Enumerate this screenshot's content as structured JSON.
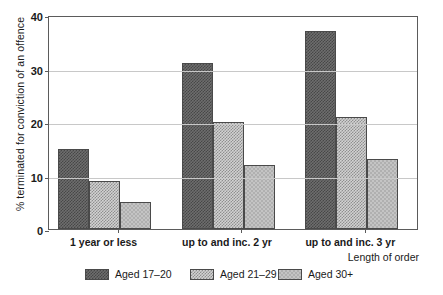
{
  "chart_data": {
    "type": "bar",
    "title": "",
    "xlabel": "Length of order",
    "ylabel": "% terminated for conviction of an offence",
    "categories": [
      "1 year or less",
      "up to and inc. 2 yr",
      "up to and inc. 3 yr"
    ],
    "series": [
      {
        "name": "Aged 17–20",
        "values": [
          15,
          31,
          37
        ],
        "pattern": "dark-checker",
        "color": "#5a5a5a"
      },
      {
        "name": "Aged 21–29",
        "values": [
          9,
          20,
          21
        ],
        "pattern": "mid-checker",
        "color": "#b4b4b4"
      },
      {
        "name": "Aged 30+",
        "values": [
          5,
          12,
          13
        ],
        "pattern": "light-checker",
        "color": "#c4c4c4"
      }
    ],
    "ylim": [
      0,
      40
    ],
    "yticks": [
      0,
      10,
      20,
      30,
      40
    ],
    "ytick_labels": [
      "0",
      "10",
      "20",
      "30",
      "40"
    ],
    "grid": true,
    "legend_position": "bottom"
  },
  "axes": {
    "y_title": "% terminated for conviction of an offence",
    "x_title": "Length of order"
  }
}
